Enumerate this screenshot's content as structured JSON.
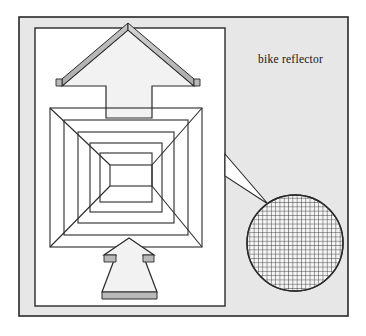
{
  "figure": {
    "name": "bike-reflector-diagram",
    "caption": "bike reflector",
    "caption_position": {
      "x": 258,
      "y": 63
    },
    "canvas": {
      "width": 366,
      "height": 336
    }
  },
  "colors": {
    "page_background": "#ffffff",
    "panel_fill": "#e7e7e7",
    "panel_stroke": "#2a2a2a",
    "inner_rect_fill": "#ffffff",
    "inner_rect_stroke": "#2a2a2a",
    "line_stroke": "#2b2b2b",
    "arrow_fill": "#f2f2f2",
    "arrow_shade": "#b9b9b9",
    "arrow_shade_dark": "#9d9d9d",
    "grid_line": "#2d2d2d",
    "circle_fill": "#f4f4f4",
    "caption_color": "#141414"
  },
  "panel": {
    "name": "outer-gray-panel",
    "x": 19,
    "y": 17,
    "width": 329,
    "height": 299
  },
  "inner_rect": {
    "name": "white-inner-rectangle",
    "x": 35,
    "y": 28,
    "width": 190,
    "height": 278
  },
  "nested_squares": {
    "name": "retroreflector-nested-squares",
    "description": "concentric rectangles with corner diagonals forming a tunnel",
    "levels": 6,
    "outer": {
      "x": 50,
      "y": 108,
      "width": 152,
      "height": 139
    },
    "inner": {
      "x": 110,
      "y": 165,
      "width": 42,
      "height": 21
    },
    "rings": [
      {
        "x": 50,
        "y": 108,
        "width": 152,
        "height": 139
      },
      {
        "x": 64,
        "y": 120,
        "width": 124,
        "height": 115
      },
      {
        "x": 78,
        "y": 132,
        "width": 96,
        "height": 91
      },
      {
        "x": 90,
        "y": 143,
        "width": 72,
        "height": 69
      },
      {
        "x": 100,
        "y": 153,
        "width": 52,
        "height": 49
      },
      {
        "x": 110,
        "y": 165,
        "width": 42,
        "height": 21
      }
    ]
  },
  "arrow_top": {
    "name": "arrow-up-top",
    "direction": "up",
    "tip": {
      "x": 128,
      "y": 30
    },
    "left_barb": {
      "x": 62,
      "y": 86
    },
    "right_barb": {
      "x": 194,
      "y": 86
    },
    "shaft_left": 106,
    "shaft_right": 152,
    "shaft_bottom": 118
  },
  "arrow_bottom": {
    "name": "arrow-up-bottom",
    "direction": "up",
    "tip": {
      "x": 129,
      "y": 238
    },
    "left_barb": {
      "x": 104,
      "y": 255
    },
    "right_barb": {
      "x": 154,
      "y": 255
    },
    "base_left": 102,
    "base_right": 157,
    "base_top": 292,
    "base_bottom": 299
  },
  "callout": {
    "name": "magnifier-callout-wedge",
    "from": {
      "x": 225,
      "y": 154
    },
    "from2": {
      "x": 225,
      "y": 176
    },
    "to": {
      "x": 268,
      "y": 204
    }
  },
  "magnifier_circle": {
    "name": "magnified-reflector-circle",
    "center": {
      "x": 295,
      "y": 243
    },
    "radius": 48,
    "grid": {
      "name": "reflector-mesh-grid",
      "spacing": 4.3,
      "cells_across": 22,
      "line_width": 0.9
    }
  },
  "labels": {
    "caption": "bike reflector"
  }
}
